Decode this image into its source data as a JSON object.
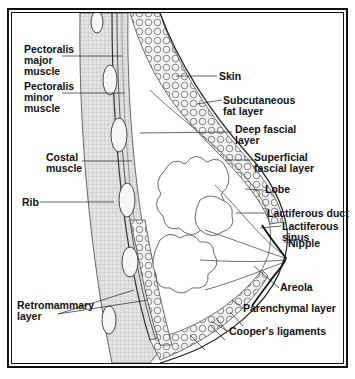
{
  "figure": {
    "colors": {
      "ink": "#111111",
      "background": "#ffffff",
      "muscle_fill": "#d9d9d9"
    }
  },
  "labels": {
    "left": [
      {
        "id": "pectoralis_major",
        "text": "Pectoralis\nmajor\nmuscle"
      },
      {
        "id": "pectoralis_minor",
        "text": "Pectoralis\nminor\nmuscle"
      },
      {
        "id": "costal_muscle",
        "text": "Costal\nmuscle"
      },
      {
        "id": "rib",
        "text": "Rib"
      },
      {
        "id": "retromammary_layer",
        "text": "Retromammary\nlayer"
      }
    ],
    "right": [
      {
        "id": "skin",
        "text": "Skin"
      },
      {
        "id": "subcutaneous_fat",
        "text": "Subcutaneous\nfat layer"
      },
      {
        "id": "deep_fascial",
        "text": "Deep fascial\nlayer"
      },
      {
        "id": "superficial_fascial",
        "text": "Superficial\nfascial layer"
      },
      {
        "id": "lobe",
        "text": "Lobe"
      },
      {
        "id": "lactiferous_duct",
        "text": "Lactiferous duct"
      },
      {
        "id": "lactiferous_sinus",
        "text": "Lactiferous\nsinus"
      },
      {
        "id": "nipple",
        "text": "Nipple"
      },
      {
        "id": "areola",
        "text": "Areola"
      },
      {
        "id": "parenchymal_layer",
        "text": "Parenchymal layer"
      },
      {
        "id": "coopers_ligaments",
        "text": "Cooper's ligaments"
      }
    ]
  }
}
